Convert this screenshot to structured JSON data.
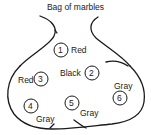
{
  "title": "Bag of marbles",
  "marbles": [
    {
      "number": "1",
      "color": "Red"
    },
    {
      "number": "2",
      "color": "Black"
    },
    {
      "number": "3",
      "color": "Red"
    },
    {
      "number": "4",
      "color": "Gray"
    },
    {
      "number": "5",
      "color": "Gray"
    },
    {
      "number": "6",
      "color": "Gray"
    }
  ],
  "colors": {
    "ink": "#1a1a1a",
    "background": "#ffffff"
  }
}
